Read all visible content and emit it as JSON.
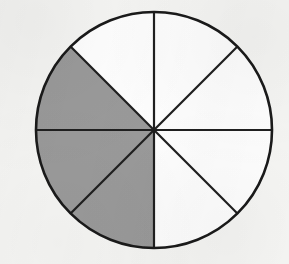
{
  "figure": {
    "name": "fraction-circle-diagram",
    "background_color": "#f6f6f4",
    "outline_color": "#1a1a1a",
    "outline_width": 2.6,
    "divider_color": "#1f1f1f",
    "divider_width": 2.2,
    "unshaded_color": "#ffffff",
    "shaded_color": "#9a9a9a",
    "center": {
      "x": 154,
      "y": 130
    },
    "radius": 118,
    "total_sectors": 8,
    "shaded_sectors": 3,
    "unshaded_sectors": 5,
    "sector_angle_degrees": 45
  },
  "chart_data": {
    "type": "pie",
    "title": "",
    "xlabel": "",
    "ylabel": "",
    "legend_position": "none",
    "grid": false,
    "categories": [
      "shaded",
      "unshaded"
    ],
    "values": [
      3,
      5
    ],
    "fraction_shaded": "3/8",
    "percent_shaded": 37.5,
    "slice_count": 8,
    "slice_value": 1,
    "slices": [
      {
        "index": 1,
        "start_deg": 270,
        "end_deg": 315,
        "shaded": false,
        "fill": "#ffffff",
        "position": "top-right-upper"
      },
      {
        "index": 2,
        "start_deg": 315,
        "end_deg": 0,
        "shaded": false,
        "fill": "#ffffff",
        "position": "right-upper"
      },
      {
        "index": 3,
        "start_deg": 0,
        "end_deg": 45,
        "shaded": false,
        "fill": "#ffffff",
        "position": "right-lower"
      },
      {
        "index": 4,
        "start_deg": 45,
        "end_deg": 90,
        "shaded": false,
        "fill": "#ffffff",
        "position": "bottom-right-lower"
      },
      {
        "index": 5,
        "start_deg": 90,
        "end_deg": 135,
        "shaded": true,
        "fill": "#9a9a9a",
        "position": "bottom-left-lower"
      },
      {
        "index": 6,
        "start_deg": 135,
        "end_deg": 180,
        "shaded": true,
        "fill": "#9a9a9a",
        "position": "left-lower"
      },
      {
        "index": 7,
        "start_deg": 180,
        "end_deg": 225,
        "shaded": true,
        "fill": "#9a9a9a",
        "position": "left-upper"
      },
      {
        "index": 8,
        "start_deg": 225,
        "end_deg": 270,
        "shaded": false,
        "fill": "#ffffff",
        "position": "top-left-upper"
      }
    ],
    "dividers": [
      {
        "name": "vertical-diameter",
        "angle_deg": 90
      },
      {
        "name": "horizontal-diameter",
        "angle_deg": 0
      },
      {
        "name": "diagonal-diameter-45",
        "angle_deg": 45
      },
      {
        "name": "diagonal-diameter-135",
        "angle_deg": 135
      }
    ]
  }
}
